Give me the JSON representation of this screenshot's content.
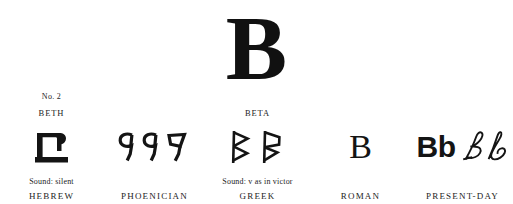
{
  "page": {
    "background_color": "#ffffff",
    "ink_color": "#141414",
    "headline_letter": "B",
    "item_number": "No. 2"
  },
  "columns": [
    {
      "id": "hebrew",
      "era_label": "HEBREW",
      "letter_name": "BETH",
      "sound": "Sound: silent",
      "number": "No. 2",
      "glyph_description": "hebrew-bet-glyph",
      "glyph_characters": [
        "ב"
      ]
    },
    {
      "id": "phoenician",
      "era_label": "PHOENICIAN",
      "letter_name": "",
      "sound": "",
      "number": "",
      "glyph_description": "phoenician-beth-glyphs",
      "glyph_characters": [
        "9",
        "9",
        "⅃"
      ]
    },
    {
      "id": "greek",
      "era_label": "GREEK",
      "letter_name": "BETA",
      "sound": "Sound: v as in victor",
      "number": "",
      "glyph_description": "greek-beta-glyphs",
      "glyph_characters": [
        "Β",
        "Β"
      ]
    },
    {
      "id": "roman",
      "era_label": "ROMAN",
      "letter_name": "",
      "sound": "",
      "number": "",
      "glyph_description": "roman-capital-b",
      "glyph_characters": [
        "B"
      ]
    },
    {
      "id": "present-day",
      "era_label": "PRESENT-DAY",
      "letter_name": "",
      "sound": "",
      "number": "",
      "glyph_description": "present-day-print-and-script-b",
      "glyph_characters": [
        "B",
        "b",
        "B",
        "b"
      ],
      "print_text": "Bb",
      "script_text": "Bb"
    }
  ]
}
